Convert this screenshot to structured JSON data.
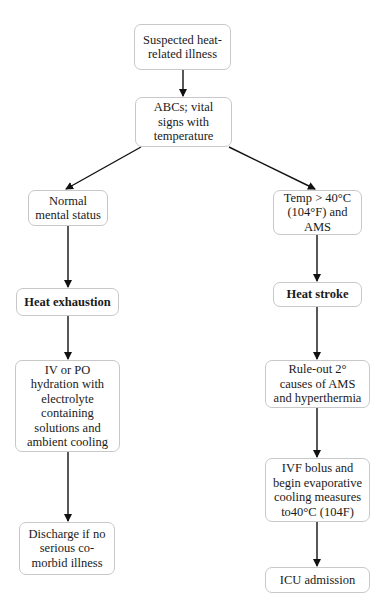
{
  "diagram": {
    "type": "flowchart",
    "title_fragment": "",
    "nodes": {
      "start": {
        "label": "Suspected heat-related illness"
      },
      "abcs": {
        "label": "ABCs; vital signs with temperature"
      },
      "normal_mental": {
        "label": "Normal mental status"
      },
      "heat_exhaustion": {
        "label": "Heat exhaustion"
      },
      "iv_po": {
        "label": "IV or PO hydration with electrolyte containing solutions and ambient cooling"
      },
      "discharge": {
        "label": "Discharge if no serious co-morbid illness"
      },
      "temp_ams": {
        "label": "Temp > 40°C (104°F) and AMS"
      },
      "heat_stroke": {
        "label": "Heat stroke"
      },
      "rule_out": {
        "label": "Rule-out 2° causes of AMS and hyperthermia"
      },
      "ivf_bolus": {
        "label": "IVF bolus and begin evaporative cooling measures to40°C (104F)"
      },
      "icu": {
        "label": "ICU admission"
      }
    },
    "edges": [
      [
        "start",
        "abcs"
      ],
      [
        "abcs",
        "normal_mental"
      ],
      [
        "abcs",
        "temp_ams"
      ],
      [
        "normal_mental",
        "heat_exhaustion"
      ],
      [
        "heat_exhaustion",
        "iv_po"
      ],
      [
        "iv_po",
        "discharge"
      ],
      [
        "temp_ams",
        "heat_stroke"
      ],
      [
        "heat_stroke",
        "rule_out"
      ],
      [
        "rule_out",
        "ivf_bolus"
      ],
      [
        "ivf_bolus",
        "icu"
      ]
    ],
    "colors": {
      "line": "#111111",
      "box_border": "#c8c8c8",
      "background": "#ffffff"
    }
  }
}
